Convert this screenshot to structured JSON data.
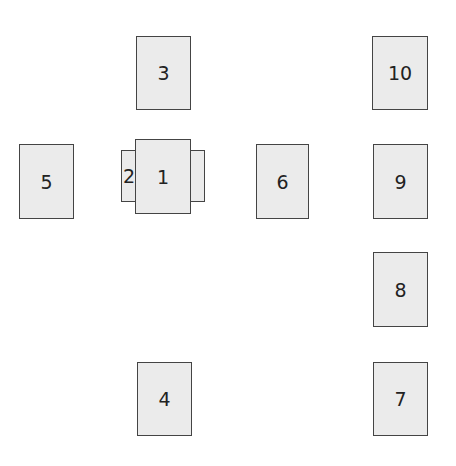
{
  "diagram": {
    "cards": [
      {
        "id": "1",
        "label": "1"
      },
      {
        "id": "2",
        "label": "2"
      },
      {
        "id": "3",
        "label": "3"
      },
      {
        "id": "4",
        "label": "4"
      },
      {
        "id": "5",
        "label": "5"
      },
      {
        "id": "6",
        "label": "6"
      },
      {
        "id": "7",
        "label": "7"
      },
      {
        "id": "8",
        "label": "8"
      },
      {
        "id": "9",
        "label": "9"
      },
      {
        "id": "10",
        "label": "10"
      }
    ],
    "colors": {
      "card_fill": "#ebebeb",
      "card_border": "#444444",
      "text": "#222222"
    }
  }
}
